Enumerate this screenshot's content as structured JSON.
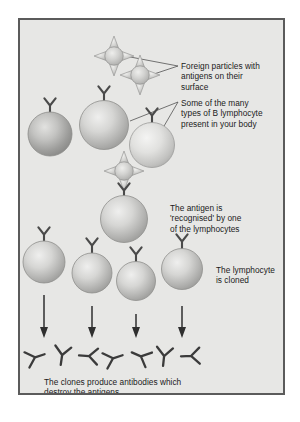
{
  "figure": {
    "panel_background": "#e7e7e5",
    "panel_border_color": "#5b5b5b",
    "page_background": "#ffffff",
    "text_color": "#1b1b1b",
    "cell_fill_light": "#e3e3e1",
    "cell_fill_mid": "#b6b6b4",
    "cell_outline": "#8f8f8d",
    "ink_color": "#3a3a3a"
  },
  "captions": {
    "foreign_particles": "Foreign particles with\nantigens on their\nsurface",
    "b_lymphocytes": "Some of the many\ntypes of B lymphocyte\npresent in your body",
    "antigen_recognised": "The antigen is\n'recognised' by one\nof the lymphocytes",
    "lymphocyte_cloned": "The lymphocyte\nis cloned",
    "clones_antibodies": "The clones produce antibodies which\ndestroy the antigens"
  },
  "diagram_data": {
    "type": "diagram",
    "stages": [
      {
        "name": "foreign-particles",
        "label": "Foreign particles with antigens on their surface",
        "element_count": 2,
        "element_kind": "spiked-antigen-particle"
      },
      {
        "name": "b-lymphocyte-variety",
        "label": "Some of the many types of B lymphocyte present in your body",
        "element_count": 3,
        "element_kind": "lymphocyte-with-receptor"
      },
      {
        "name": "antigen-recognition",
        "label": "The antigen is 'recognised' by one of the lymphocytes",
        "element_count": 1,
        "element_kind": "lymphocyte-bound-to-antigen"
      },
      {
        "name": "clonal-expansion",
        "label": "The lymphocyte is cloned",
        "element_count": 4,
        "element_kind": "lymphocyte-with-receptor"
      },
      {
        "name": "antibody-production",
        "label": "The clones produce antibodies which destroy the antigens",
        "element_count": 7,
        "element_kind": "antibody-y-shape",
        "arrow_count": 4
      }
    ],
    "antigens": [
      {
        "id": "antigen-1",
        "cx": 94,
        "cy": 36,
        "r": 9.5,
        "spikes": 4
      },
      {
        "id": "antigen-2",
        "cx": 120,
        "cy": 54,
        "r": 9.5,
        "spikes": 4
      },
      {
        "id": "antigen-3",
        "cx": 105,
        "cy": 152,
        "r": 9.5,
        "spikes": 4
      }
    ],
    "lymphocytes_row1": [
      {
        "id": "lymphocyte-1",
        "cx": 35,
        "cy": 114,
        "r": 22
      },
      {
        "id": "lymphocyte-2",
        "cx": 86,
        "cy": 105,
        "r": 25
      },
      {
        "id": "lymphocyte-3",
        "cx": 134,
        "cy": 125,
        "r": 23
      }
    ],
    "lymphocyte_selected": {
      "id": "lymphocyte-selected",
      "cx": 105,
      "cy": 199,
      "r": 24
    },
    "lymphocyte_clones": [
      {
        "id": "clone-1",
        "cx": 31,
        "cy": 241,
        "r": 21
      },
      {
        "id": "clone-2",
        "cx": 79,
        "cy": 252,
        "r": 20
      },
      {
        "id": "clone-3",
        "cx": 122,
        "cy": 260,
        "r": 20
      },
      {
        "id": "clone-4",
        "cx": 168,
        "cy": 249,
        "r": 21
      }
    ],
    "arrows": [
      {
        "id": "arrow-1",
        "x": 30,
        "y_start": 278,
        "y_end": 318
      },
      {
        "id": "arrow-2",
        "x": 79,
        "y_start": 288,
        "y_end": 318
      },
      {
        "id": "arrow-3",
        "x": 122,
        "y_start": 296,
        "y_end": 318
      },
      {
        "id": "arrow-4",
        "x": 168,
        "y_start": 288,
        "y_end": 318
      }
    ],
    "antibodies": [
      {
        "id": "antibody-1",
        "cx": 22,
        "cy": 337,
        "rotation": -108
      },
      {
        "id": "antibody-2",
        "cx": 48,
        "cy": 337,
        "rotation": 8
      },
      {
        "id": "antibody-3",
        "cx": 74,
        "cy": 336,
        "rotation": 92
      },
      {
        "id": "antibody-4",
        "cx": 100,
        "cy": 338,
        "rotation": -108
      },
      {
        "id": "antibody-5",
        "cx": 126,
        "cy": 336,
        "rotation": 112
      },
      {
        "id": "antibody-6",
        "cx": 150,
        "cy": 337,
        "rotation": 6
      },
      {
        "id": "antibody-7",
        "cx": 176,
        "cy": 336,
        "rotation": 86
      }
    ],
    "leader_lines": [
      {
        "id": "leader-antigen-a",
        "from": [
          106,
          36
        ],
        "to": [
          158,
          46
        ]
      },
      {
        "id": "leader-antigen-b",
        "from": [
          132,
          54
        ],
        "to": [
          158,
          46
        ]
      },
      {
        "id": "leader-lymphocyte-a",
        "from": [
          108,
          102
        ],
        "to": [
          158,
          83
        ]
      },
      {
        "id": "leader-lymphocyte-b",
        "from": [
          141,
          112
        ],
        "to": [
          158,
          83
        ]
      }
    ]
  }
}
